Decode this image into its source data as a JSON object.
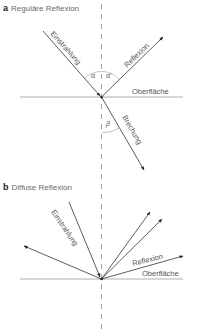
{
  "panels": {
    "a": {
      "letter": "a",
      "title": "Reguläre Reflexion",
      "labels": {
        "incident": "Einstrahlung",
        "reflection": "Reflexion",
        "surface": "Oberfläche",
        "refraction": "Brechung",
        "angle_incidence": "α",
        "angle_reflection": "α'",
        "angle_refraction": "β"
      }
    },
    "b": {
      "letter": "b",
      "title": "Diffuse Reflexion",
      "labels": {
        "incident": "Einstrahlung",
        "reflection": "Reflexion",
        "surface": "Oberfläche"
      }
    }
  },
  "colors": {
    "line": "#333333",
    "surface": "#9a9a9a",
    "dashed": "#8a8a8a",
    "text": "#555555"
  }
}
